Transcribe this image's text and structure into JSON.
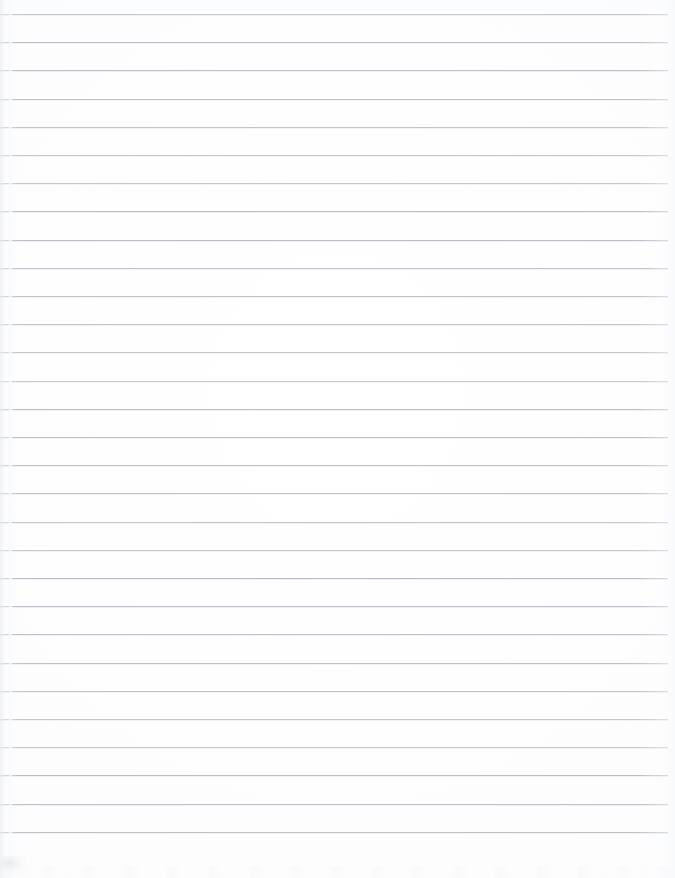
{
  "document": {
    "kind": "blank-ruled-notebook-paper",
    "title": "Blank Ruled Notebook Page",
    "written_text": "",
    "page_width": 675,
    "page_height": 878,
    "background_color": "#fdfdfd"
  },
  "ruling": {
    "line_color": "#b9bdc3",
    "line_thickness_px": 1,
    "line_count": 30,
    "first_line_y": 14,
    "line_spacing_px": 28.2,
    "line_left_x": 0,
    "line_right_x": 668,
    "last_line_y": 845,
    "line_y_positions": [
      14,
      42.2,
      70.4,
      98.6,
      126.8,
      155,
      183.2,
      211.4,
      239.6,
      267.8,
      296,
      324.2,
      352.4,
      380.6,
      408.8,
      437,
      465.2,
      493.4,
      521.6,
      549.8,
      578,
      606.2,
      634.4,
      662.6,
      690.8,
      719,
      747.2,
      775.4,
      803.6,
      831.8
    ]
  },
  "artifacts": {
    "left_scan_band_x": 9,
    "left_scan_band_width": 5,
    "bottom_left_smudge_x": 0,
    "bottom_left_smudge_y": 856,
    "bottom_noise_y": 866
  }
}
